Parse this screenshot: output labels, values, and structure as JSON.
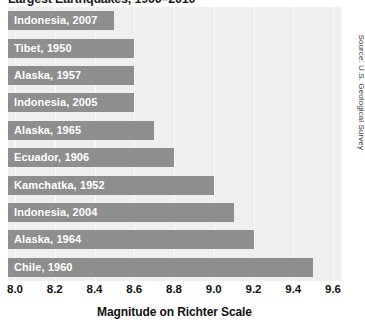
{
  "chart_data": {
    "type": "bar",
    "orientation": "horizontal",
    "title": "Largest Earthquakes, 1900–2010",
    "xlabel": "Magnitude on Richter Scale",
    "ylabel": "",
    "xlim": [
      8.0,
      9.6
    ],
    "grid": true,
    "legend": null,
    "categories": [
      "Indonesia, 2007",
      "Tibet, 1950",
      "Alaska, 1957",
      "Indonesia, 2005",
      "Alaska, 1965",
      "Ecuador, 1906",
      "Kamchatka, 1952",
      "Indonesia, 2004",
      "Alaska, 1964",
      "Chile, 1960"
    ],
    "values": [
      8.5,
      8.6,
      8.6,
      8.6,
      8.7,
      8.8,
      9.0,
      9.1,
      9.2,
      9.5
    ],
    "tick_labels": [
      "8.0",
      "8.2",
      "8.4",
      "8.6",
      "8.8",
      "9.0",
      "9.2",
      "9.4",
      "9.6"
    ],
    "tick_values": [
      8.0,
      8.2,
      8.4,
      8.6,
      8.8,
      9.0,
      9.2,
      9.4,
      9.6
    ],
    "bar_color": "#8e8e8e",
    "bar_label_color": "#ffffff",
    "plot_background": "#efefef",
    "gridline_color": "#fbfbfb"
  },
  "source": {
    "credit": "Source: U.S. Geological Survey"
  }
}
